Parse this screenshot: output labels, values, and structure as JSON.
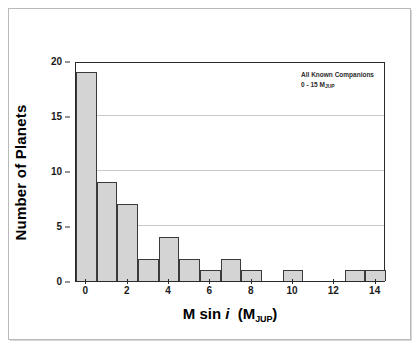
{
  "figure": {
    "background_color": "#ffffff",
    "frame_color": "#b9b9b9"
  },
  "annotation": {
    "line1": "All Known Companions",
    "line2_prefix": "0 - 15 M",
    "line2_subscript": "JUP"
  },
  "axes": {
    "x_title_main": "M sin",
    "x_title_italic": "i",
    "x_title_paren_open": "(M",
    "x_title_subscript": "JUP",
    "x_title_paren_close": ")",
    "y_title": "Number of Planets",
    "x_ticks": [
      "0",
      "2",
      "4",
      "6",
      "8",
      "10",
      "12",
      "14"
    ],
    "y_ticks": [
      "0",
      "5",
      "10",
      "15",
      "20"
    ]
  },
  "chart_data": {
    "type": "bar",
    "title": "",
    "subtitle": "",
    "xlabel": "M sin i (M_JUP)",
    "ylabel": "Number of Planets",
    "categories": [
      "0",
      "1",
      "2",
      "3",
      "4",
      "5",
      "6",
      "7",
      "8",
      "9",
      "10",
      "11",
      "12",
      "13",
      "14"
    ],
    "values": [
      19,
      9,
      7,
      2,
      4,
      2,
      1,
      2,
      1,
      0,
      1,
      0,
      0,
      1,
      1
    ],
    "bin_width": 1,
    "xlim": [
      -0.5,
      14.5
    ],
    "ylim": [
      0,
      20
    ],
    "xtick_values": [
      0,
      2,
      4,
      6,
      8,
      10,
      12,
      14
    ],
    "ytick_values": [
      0,
      5,
      10,
      15,
      20
    ],
    "grid": "horizontal",
    "gridline_values": [
      5,
      10,
      15
    ],
    "legend": "none",
    "annotations": [
      "All Known Companions",
      "0 - 15 M_JUP"
    ],
    "bar_fill_color": "#d4d4d4",
    "bar_edge_color": "#3a3a3a",
    "gridline_color": "#c9c9c9",
    "axis_color": "#2a2a2a"
  }
}
